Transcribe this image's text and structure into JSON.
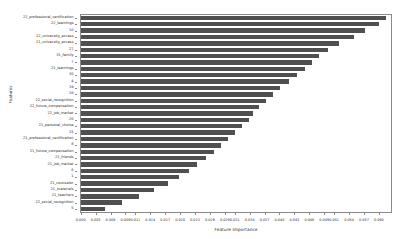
{
  "chart_data": {
    "type": "bar",
    "orientation": "horizontal",
    "title": "",
    "xlabel": "Feature Importance",
    "ylabel": "Features",
    "xlim": [
      0.0,
      0.0625
    ],
    "grid": false,
    "legend": null,
    "bar_color": "#4f4f4f",
    "xticks": [
      "0.000",
      "0.003",
      "0.006",
      "0.009",
      "0.011",
      "0.014",
      "0.017",
      "0.020",
      "0.023",
      "0.026",
      "0.029",
      "0.031",
      "0.034",
      "0.037",
      "0.040",
      "0.043",
      "0.046",
      "0.049",
      "0.051",
      "0.054",
      "0.057",
      "0.060"
    ],
    "xtick_values": [
      0.0,
      0.003,
      0.006,
      0.009,
      0.011,
      0.014,
      0.017,
      0.02,
      0.023,
      0.026,
      0.029,
      0.031,
      0.034,
      0.037,
      0.04,
      0.043,
      0.046,
      0.049,
      0.051,
      0.054,
      0.057,
      0.06
    ],
    "categories": [
      "22_professional_certification",
      "22_learnings",
      "10",
      "22_university_access",
      "21_university_access",
      "27",
      "31_family",
      "7",
      "21_learnings",
      "30",
      "4",
      "19",
      "16",
      "22_social_recognition",
      "22_future_compensation",
      "22_job_market",
      "20",
      "21_personal_choice",
      "15",
      "21_professional_certification",
      "8",
      "21_future_compensation",
      "21_friends",
      "21_job_market",
      "6",
      "1",
      "21_counselor",
      "21_materials",
      "21_teachers",
      "22_social_recognition",
      "5"
    ],
    "values": [
      0.0615,
      0.06,
      0.0573,
      0.0549,
      0.052,
      0.0497,
      0.048,
      0.0466,
      0.0452,
      0.0436,
      0.0419,
      0.0401,
      0.0387,
      0.0372,
      0.0358,
      0.0347,
      0.0338,
      0.0325,
      0.031,
      0.0296,
      0.0282,
      0.0268,
      0.0252,
      0.0234,
      0.0218,
      0.0197,
      0.0175,
      0.0148,
      0.0117,
      0.0084,
      0.0048
    ]
  }
}
